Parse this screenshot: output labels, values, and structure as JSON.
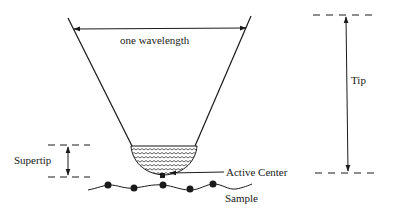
{
  "diagram": {
    "type": "schematic",
    "labels": {
      "wavelength": "one wavelength",
      "tip": "Tip",
      "supertip": "Supertip",
      "active_center": "Active Center",
      "sample": "Sample"
    },
    "colors": {
      "stroke": "#1a1a1a",
      "background": "#ffffff"
    }
  }
}
